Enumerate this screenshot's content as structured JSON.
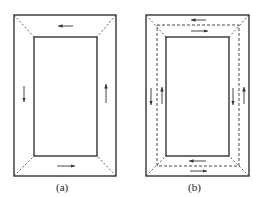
{
  "figures": [
    {
      "id": "a",
      "label": "(a)",
      "description": "Rectangular frame with single circulation: left arrow down, top arrow left, right arrow up, bottom arrow right"
    },
    {
      "id": "b",
      "label": "(b)",
      "description": "Rectangular frame with dashed mid-line, opposing arrows on each side of the dashed line"
    }
  ],
  "colors": {
    "line": "#333333",
    "background": "#ffffff"
  }
}
